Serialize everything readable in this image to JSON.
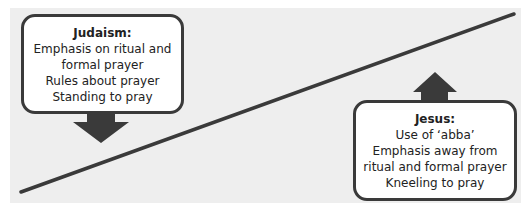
{
  "diagram": {
    "type": "balance-line comparison",
    "colors": {
      "panel": "#eeeeee",
      "line": "#3a3a3a",
      "arrow": "#3a3a3a",
      "box_border": "#3a3a3a",
      "box_fill": "#ffffff",
      "text": "#222222"
    },
    "left_box": {
      "title": "Judaism:",
      "lines": [
        "Emphasis on ritual and",
        "formal prayer",
        "Rules about prayer",
        "Standing to pray"
      ],
      "arrow": "arrow-down"
    },
    "right_box": {
      "title": "Jesus:",
      "lines": [
        "Use of ‘abba’",
        "Emphasis away from",
        "ritual and formal prayer",
        "Kneeling to pray"
      ],
      "arrow": "arrow-up"
    },
    "line": {
      "from": [
        21,
        192
      ],
      "to": [
        514,
        14
      ]
    }
  }
}
